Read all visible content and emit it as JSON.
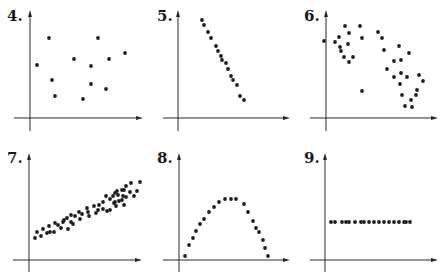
{
  "chart_data": [
    {
      "id": "4",
      "label": "4.",
      "type": "scatter",
      "description": "No correlation",
      "axes": {
        "origin": [
          30,
          118
        ],
        "x_end": 143,
        "x_start": 14,
        "y_top": 10,
        "y_bottom": 131
      },
      "label_pos": [
        7,
        9
      ],
      "points": [
        [
          37,
          65
        ],
        [
          49,
          38
        ],
        [
          52,
          80
        ],
        [
          55,
          96
        ],
        [
          74,
          59
        ],
        [
          83,
          99
        ],
        [
          91,
          66
        ],
        [
          91,
          84
        ],
        [
          98,
          38
        ],
        [
          109,
          59
        ],
        [
          106,
          89
        ],
        [
          125,
          53
        ]
      ]
    },
    {
      "id": "5",
      "label": "5.",
      "type": "scatter",
      "description": "Strong negative linear correlation",
      "axes": {
        "origin": [
          178,
          118
        ],
        "x_end": 290,
        "x_start": 163,
        "y_top": 10,
        "y_bottom": 131
      },
      "label_pos": [
        157,
        9
      ],
      "points": [
        [
          202,
          20
        ],
        [
          204,
          25
        ],
        [
          208,
          32
        ],
        [
          211,
          38
        ],
        [
          216,
          46
        ],
        [
          218,
          51
        ],
        [
          221,
          56
        ],
        [
          222,
          60
        ],
        [
          226,
          63
        ],
        [
          228,
          69
        ],
        [
          231,
          76
        ],
        [
          233,
          80
        ],
        [
          237,
          85
        ],
        [
          240,
          96
        ],
        [
          244,
          100
        ]
      ]
    },
    {
      "id": "6",
      "label": "6.",
      "type": "scatter",
      "description": "Moderate negative correlation",
      "axes": {
        "origin": [
          326,
          118
        ],
        "x_end": 438,
        "x_start": 310,
        "y_top": 10,
        "y_bottom": 131
      },
      "label_pos": [
        304,
        9
      ],
      "points": [
        [
          345,
          26
        ],
        [
          360,
          26
        ],
        [
          335,
          42
        ],
        [
          339,
          37
        ],
        [
          349,
          33
        ],
        [
          362,
          38
        ],
        [
          348,
          44
        ],
        [
          340,
          47
        ],
        [
          349,
          62
        ],
        [
          344,
          57
        ],
        [
          324,
          41
        ],
        [
          353,
          57
        ],
        [
          341,
          51
        ],
        [
          362,
          91
        ],
        [
          378,
          32
        ],
        [
          382,
          38
        ],
        [
          384,
          50
        ],
        [
          387,
          69
        ],
        [
          394,
          61
        ],
        [
          399,
          46
        ],
        [
          401,
          60
        ],
        [
          394,
          77
        ],
        [
          409,
          53
        ],
        [
          401,
          73
        ],
        [
          407,
          77
        ],
        [
          400,
          84
        ],
        [
          402,
          95
        ],
        [
          411,
          100
        ],
        [
          416,
          95
        ],
        [
          423,
          81
        ],
        [
          417,
          90
        ],
        [
          419,
          75
        ],
        [
          412,
          107
        ],
        [
          405,
          106
        ]
      ]
    },
    {
      "id": "7",
      "label": "7.",
      "type": "scatter",
      "description": "Strong positive linear correlation",
      "axes": {
        "origin": [
          29,
          260
        ],
        "x_end": 142,
        "x_start": 13,
        "y_top": 153,
        "y_bottom": 272
      },
      "label_pos": [
        7,
        151
      ],
      "points": [
        [
          35,
          238
        ],
        [
          37,
          232
        ],
        [
          41,
          236
        ],
        [
          43,
          229
        ],
        [
          47,
          233
        ],
        [
          49,
          226
        ],
        [
          50,
          232
        ],
        [
          54,
          232
        ],
        [
          55,
          223
        ],
        [
          58,
          225
        ],
        [
          61,
          228
        ],
        [
          63,
          222
        ],
        [
          64,
          220
        ],
        [
          67,
          218
        ],
        [
          68,
          229
        ],
        [
          71,
          222
        ],
        [
          71,
          215
        ],
        [
          75,
          216
        ],
        [
          73,
          224
        ],
        [
          79,
          212
        ],
        [
          80,
          219
        ],
        [
          82,
          214
        ],
        [
          87,
          208
        ],
        [
          88,
          212
        ],
        [
          89,
          216
        ],
        [
          94,
          206
        ],
        [
          96,
          213
        ],
        [
          98,
          210
        ],
        [
          99,
          205
        ],
        [
          103,
          209
        ],
        [
          103,
          202
        ],
        [
          106,
          196
        ],
        [
          107,
          211
        ],
        [
          110,
          199
        ],
        [
          110,
          210
        ],
        [
          113,
          196
        ],
        [
          114,
          203
        ],
        [
          115,
          193
        ],
        [
          115,
          202
        ],
        [
          116,
          206
        ],
        [
          117,
          191
        ],
        [
          119,
          201
        ],
        [
          122,
          190
        ],
        [
          123,
          196
        ],
        [
          124,
          190
        ],
        [
          126,
          197
        ],
        [
          126,
          186
        ],
        [
          130,
          192
        ],
        [
          131,
          183
        ],
        [
          134,
          196
        ],
        [
          137,
          191
        ],
        [
          140,
          182
        ],
        [
          122,
          200
        ],
        [
          124,
          205
        ],
        [
          118,
          195
        ]
      ]
    },
    {
      "id": "8",
      "label": "8.",
      "type": "scatter",
      "description": "Nonlinear (quadratic / inverted parabola) relationship",
      "axes": {
        "origin": [
          179,
          260
        ],
        "x_end": 290,
        "x_start": 163,
        "y_top": 153,
        "y_bottom": 272
      },
      "label_pos": [
        157,
        151
      ],
      "points": [
        [
          185,
          256
        ],
        [
          189,
          245
        ],
        [
          193,
          238
        ],
        [
          196,
          231
        ],
        [
          200,
          224
        ],
        [
          204,
          219
        ],
        [
          209,
          212
        ],
        [
          214,
          207
        ],
        [
          219,
          202
        ],
        [
          225,
          199
        ],
        [
          231,
          199
        ],
        [
          236,
          199
        ],
        [
          244,
          204
        ],
        [
          248,
          212
        ],
        [
          253,
          221
        ],
        [
          256,
          228
        ],
        [
          259,
          232
        ],
        [
          263,
          240
        ],
        [
          265,
          248
        ],
        [
          268,
          256
        ]
      ]
    },
    {
      "id": "9",
      "label": "9.",
      "type": "scatter",
      "description": "Zero slope (horizontal line) — no linear correlation",
      "axes": {
        "origin": [
          325,
          260
        ],
        "x_end": 438,
        "x_start": 310,
        "y_top": 153,
        "y_bottom": 272
      },
      "label_pos": [
        304,
        151
      ],
      "points": [
        [
          331,
          222
        ],
        [
          335,
          222
        ],
        [
          342,
          222
        ],
        [
          346,
          222
        ],
        [
          349,
          222
        ],
        [
          355,
          222
        ],
        [
          361,
          222
        ],
        [
          364,
          222
        ],
        [
          369,
          222
        ],
        [
          374,
          222
        ],
        [
          379,
          222
        ],
        [
          384,
          222
        ],
        [
          389,
          222
        ],
        [
          394,
          222
        ],
        [
          399,
          222
        ],
        [
          404,
          222
        ],
        [
          406,
          222
        ],
        [
          410,
          222
        ]
      ]
    }
  ],
  "style": {
    "point_color": "#1e1e1e",
    "axis_color": "#2a2a2a",
    "point_radius": 1.9,
    "background": "#ffffff"
  }
}
